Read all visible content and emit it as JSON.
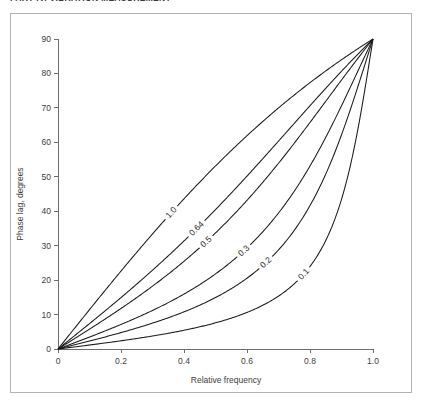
{
  "page": {
    "header_text": "PART IV. VIBRATION MEASUREMENT",
    "background_color": "#ffffff",
    "frame_color": "#b3b3b3"
  },
  "figure": {
    "axis_color": "#6e6e6e",
    "curve_color": "#1a1a1a",
    "text_color": "#3d3d3d"
  },
  "chart_data": {
    "type": "line",
    "title": "",
    "xlabel": "Relative frequency",
    "ylabel": "Phase lag, degrees",
    "xlim": [
      0,
      1.0
    ],
    "ylim": [
      0,
      90
    ],
    "xticks": [
      0,
      0.2,
      0.4,
      0.6,
      0.8,
      1.0
    ],
    "xticklabels": [
      "0",
      "0.2",
      "0.4",
      "0.6",
      "0.8",
      "1.0"
    ],
    "yticks": [
      0,
      10,
      20,
      30,
      40,
      50,
      60,
      70,
      80,
      90
    ],
    "yticklabels": [
      "0",
      "10",
      "20",
      "30",
      "40",
      "50",
      "60",
      "70",
      "80",
      "90"
    ],
    "grid": false,
    "legend": "inline-curve-labels",
    "formula": "phase = atan(2*zeta*r/(1-r^2)) in degrees",
    "x": [
      0,
      0.05,
      0.1,
      0.15,
      0.2,
      0.25,
      0.3,
      0.35,
      0.4,
      0.45,
      0.5,
      0.55,
      0.6,
      0.65,
      0.7,
      0.75,
      0.8,
      0.85,
      0.9,
      0.95,
      1.0
    ],
    "series": [
      {
        "name": "0.1",
        "zeta": 0.1,
        "label": "0.1",
        "label_at_x": 0.78,
        "values": [
          0,
          0.57,
          1.16,
          1.77,
          2.39,
          3.05,
          3.77,
          4.55,
          5.44,
          6.47,
          7.69,
          9.2,
          11.1,
          13.6,
          17.1,
          22.2,
          29.9,
          41.6,
          56.5,
          71.2,
          90
        ]
      },
      {
        "name": "0.2",
        "zeta": 0.2,
        "label": "0.2",
        "label_at_x": 0.66,
        "values": [
          0,
          1.15,
          2.31,
          3.53,
          4.77,
          6.09,
          7.53,
          9.09,
          10.85,
          12.87,
          15.25,
          18.14,
          21.71,
          26.2,
          32.0,
          39.5,
          49.0,
          60.2,
          71.6,
          80.9,
          90
        ]
      },
      {
        "name": "0.3",
        "zeta": 0.3,
        "label": "0.3",
        "label_at_x": 0.59,
        "values": [
          0,
          1.72,
          3.46,
          5.28,
          7.13,
          9.1,
          11.22,
          13.54,
          16.12,
          19.05,
          22.44,
          26.47,
          31.3,
          37.2,
          44.3,
          52.7,
          61.9,
          71.1,
          79.1,
          85.0,
          90
        ]
      },
      {
        "name": "0.5",
        "zeta": 0.5,
        "label": "0.5",
        "label_at_x": 0.47,
        "values": [
          0,
          2.87,
          5.77,
          8.78,
          11.8,
          15.0,
          18.4,
          22.1,
          26.1,
          30.6,
          35.7,
          41.4,
          47.9,
          55.1,
          62.8,
          70.6,
          77.3,
          82.4,
          85.9,
          88.1,
          90
        ]
      },
      {
        "name": "0.64",
        "zeta": 0.64,
        "label": "0.64",
        "label_at_x": 0.44,
        "values": [
          0,
          3.66,
          7.37,
          11.2,
          15.1,
          19.1,
          23.4,
          28.0,
          32.9,
          38.3,
          44.3,
          50.8,
          57.8,
          65.1,
          72.1,
          78.3,
          83.1,
          86.3,
          88.2,
          89.3,
          90
        ]
      },
      {
        "name": "1.0",
        "zeta": 1.0,
        "label": "1.0",
        "label_at_x": 0.36,
        "values": [
          0,
          5.72,
          11.5,
          17.3,
          23.2,
          29.1,
          35.1,
          41.2,
          47.5,
          53.8,
          60.3,
          66.8,
          73.2,
          79.1,
          84.2,
          88.0,
          90.4,
          91.2,
          90.9,
          90.5,
          90
        ]
      }
    ]
  }
}
